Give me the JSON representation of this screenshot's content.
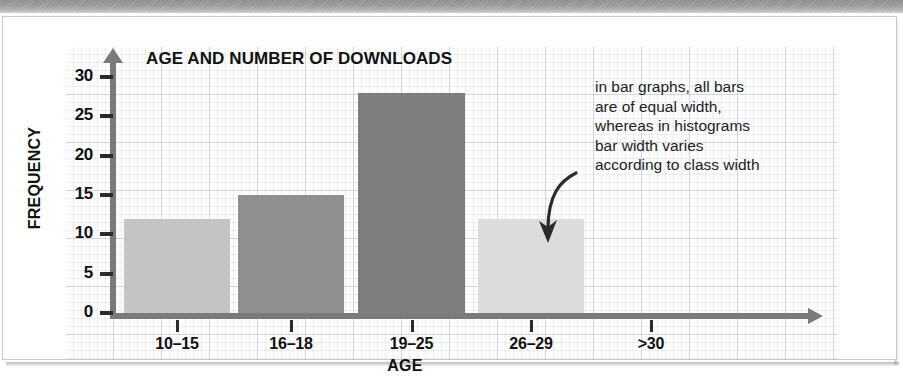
{
  "chart_data": {
    "type": "bar",
    "title": "AGE AND NUMBER OF DOWNLOADS",
    "xlabel": "AGE",
    "ylabel": "FREQUENCY",
    "categories": [
      "10–15",
      "16–18",
      "19–25",
      "26–29",
      ">30"
    ],
    "values": [
      12,
      15,
      28,
      12,
      0
    ],
    "bar_colors": [
      "#c4c4c4",
      "#8f8f8f",
      "#7e7e7e",
      "#dcdcdc",
      "none"
    ],
    "ylim": [
      0,
      32
    ],
    "yticks": [
      0,
      5,
      10,
      15,
      20,
      25,
      30
    ],
    "ytick_labels": [
      "0",
      "5",
      "10",
      "15",
      "20",
      "25",
      "30"
    ],
    "grid": true,
    "legend": "none",
    "annotations": [
      "in bar graphs, all bars",
      "are of equal width,",
      "whereas in histograms",
      "bar width varies",
      "according to class width"
    ]
  },
  "figure": {
    "axis_color": "#7a7a7a",
    "text_color": "#111111",
    "paper_background": "#fdfdfd",
    "grid_color": "#96a0b9"
  }
}
